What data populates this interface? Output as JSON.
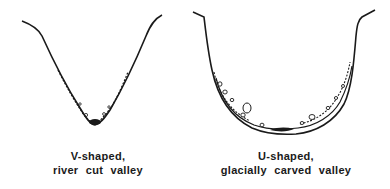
{
  "diagram": {
    "panels": [
      {
        "id": "v-valley",
        "shape": "V-shaped",
        "label_line1": "V-shaped,",
        "label_line2": "river cut valley",
        "color": "#1a1a1a"
      },
      {
        "id": "u-valley",
        "shape": "U-shaped",
        "label_line1": "U-shaped,",
        "label_line2": "glacially carved valley",
        "color": "#1a1a1a"
      }
    ]
  }
}
